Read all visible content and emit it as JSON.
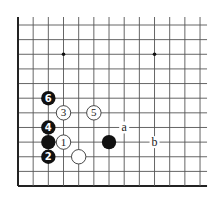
{
  "diagram": {
    "type": "go-board-fragment",
    "grid": {
      "columns": 13,
      "rows": 12,
      "origin_x": 18,
      "origin_y": 25,
      "spacing_x": 15.17,
      "spacing_y": 14.64,
      "left_edge": true,
      "bottom_edge": true,
      "colors": {
        "line": "#555555",
        "edge": "#222222",
        "background": "#ffffff"
      }
    },
    "star_points": [
      {
        "col": 3,
        "row": 2
      },
      {
        "col": 9,
        "row": 2
      }
    ],
    "stones": [
      {
        "color": "black",
        "col": 2,
        "row": 5,
        "label": "6"
      },
      {
        "color": "white",
        "col": 3,
        "row": 6,
        "label": "3"
      },
      {
        "color": "white",
        "col": 5,
        "row": 6,
        "label": "5"
      },
      {
        "color": "black",
        "col": 2,
        "row": 7,
        "label": "4"
      },
      {
        "color": "black",
        "col": 2,
        "row": 8,
        "label": ""
      },
      {
        "color": "white",
        "col": 3,
        "row": 8,
        "label": "1"
      },
      {
        "color": "black",
        "col": 6,
        "row": 8,
        "label": ""
      },
      {
        "color": "black",
        "col": 2,
        "row": 9,
        "label": "2"
      },
      {
        "color": "white",
        "col": 4,
        "row": 9,
        "label": ""
      }
    ],
    "markers": [
      {
        "col": 7,
        "row": 7,
        "text": "a"
      },
      {
        "col": 9,
        "row": 8,
        "text": "b"
      }
    ]
  }
}
